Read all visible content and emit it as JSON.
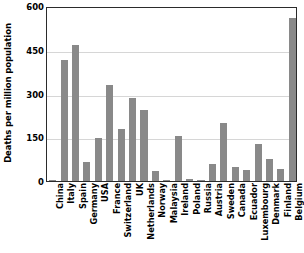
{
  "chart_data": {
    "type": "bar",
    "title": "",
    "xlabel": "",
    "ylabel": "Deaths per million population",
    "ylim": [
      0,
      600
    ],
    "yticks": [
      0,
      150,
      300,
      450,
      600
    ],
    "grid": true,
    "legend": null,
    "bar_color": "#898989",
    "categories": [
      "China",
      "Italy",
      "Spain",
      "Germany",
      "USA",
      "France",
      "Switzerland",
      "UK",
      "Netherlands",
      "Norway",
      "Malaysia",
      "Ireland",
      "Poland",
      "Russia",
      "Austria",
      "Sweden",
      "Canada",
      "Ecuador",
      "Luxembourg",
      "Denmark",
      "Finland",
      "Belgium"
    ],
    "values": [
      2,
      416,
      468,
      66,
      148,
      330,
      178,
      283,
      245,
      36,
      2,
      155,
      8,
      3,
      57,
      198,
      49,
      37,
      128,
      74,
      42,
      559
    ]
  }
}
